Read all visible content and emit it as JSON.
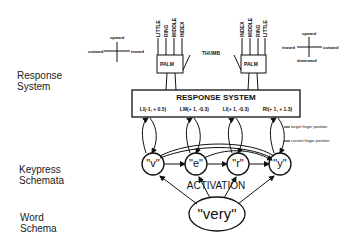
{
  "levels": {
    "response": [
      "Response",
      "System"
    ],
    "keypress": [
      "Keypress",
      "Schemata"
    ],
    "word": [
      "Word",
      "Schema"
    ]
  },
  "left_hand": {
    "fingers": [
      "LITTLE",
      "RING",
      "MIDDLE",
      "INDEX"
    ],
    "palm": "PALM"
  },
  "right_hand": {
    "fingers": [
      "INDEX",
      "MIDDLE",
      "RING",
      "LITTLE"
    ],
    "palm": "PALM"
  },
  "thumb_label": "THUMB",
  "left_compass": {
    "up": "upward",
    "left": "outward",
    "right": "inward"
  },
  "right_compass": {
    "up": "upward",
    "down": "downward",
    "left": "inward",
    "right": "outward"
  },
  "response_box": {
    "title": "RESPONSE SYSTEM",
    "targets": [
      "LI(-1, + 0.5)",
      "LM(+ 1, -0.3)",
      "LI(+ 1, -0.3)",
      "RI(+ 1, + 1.3)"
    ]
  },
  "annotations": {
    "target": "target finger position",
    "current": "current finger position"
  },
  "keypress_nodes": [
    "\"v\"",
    "\"e\"",
    "\"r\"",
    "\"y\""
  ],
  "activation_label": "ACTIVATION",
  "word_node": "\"very\""
}
